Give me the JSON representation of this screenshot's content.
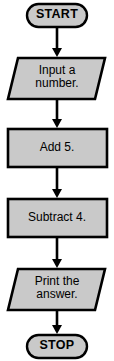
{
  "diagram": {
    "type": "flowchart",
    "background_color": "#ffffff",
    "shape_fill_color": "#c9c9c9",
    "shape_stroke_color": "#000000",
    "connector_color": "#000000",
    "nodes": [
      {
        "id": "start",
        "shape": "terminator",
        "label": "START",
        "x": 26,
        "y": 3,
        "width": 62,
        "height": 25
      },
      {
        "id": "input-number",
        "shape": "parallelogram",
        "label": "Input a\nnumber.",
        "x": 8,
        "y": 57,
        "width": 98,
        "height": 43
      },
      {
        "id": "add-five",
        "shape": "process",
        "label": "Add 5.",
        "x": 7,
        "y": 128,
        "width": 101,
        "height": 40
      },
      {
        "id": "subtract-four",
        "shape": "process",
        "label": "Subtract 4.",
        "x": 7,
        "y": 198,
        "width": 101,
        "height": 40
      },
      {
        "id": "print-answer",
        "shape": "parallelogram",
        "label": "Print the\nanswer.",
        "x": 8,
        "y": 268,
        "width": 98,
        "height": 43
      },
      {
        "id": "stop",
        "shape": "terminator",
        "label": "STOP",
        "x": 26,
        "y": 334,
        "width": 62,
        "height": 25
      }
    ],
    "connectors": [
      {
        "id": "start-to-input",
        "from": "start",
        "to": "input-number",
        "arrow": "down"
      },
      {
        "id": "input-to-add",
        "from": "input-number",
        "to": "add-five",
        "arrow": "down"
      },
      {
        "id": "add-to-subtract",
        "from": "add-five",
        "to": "subtract-four",
        "arrow": "down"
      },
      {
        "id": "subtract-to-print",
        "from": "subtract-four",
        "to": "print-answer",
        "arrow": "down"
      },
      {
        "id": "print-to-stop",
        "from": "print-answer",
        "to": "stop",
        "arrow": "down"
      }
    ]
  }
}
